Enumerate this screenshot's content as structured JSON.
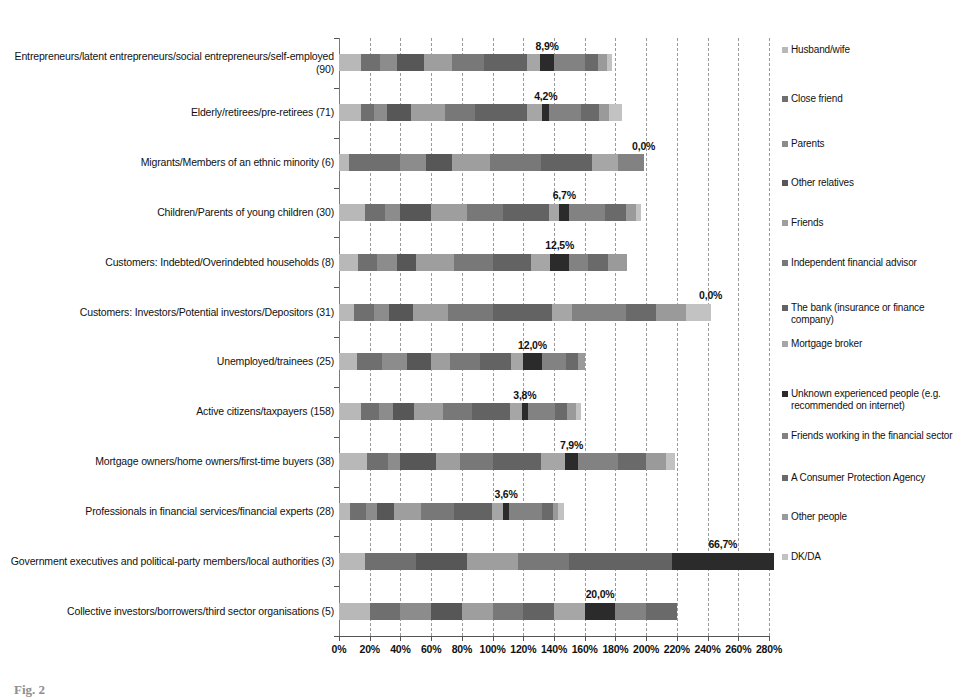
{
  "chart_data": {
    "type": "bar",
    "orientation": "horizontal",
    "stacked": true,
    "title": "",
    "xlabel": "",
    "ylabel": "",
    "xlim": [
      0,
      280
    ],
    "grid": true,
    "legend_position": "right",
    "xticklabels": [
      "0%",
      "20%",
      "40%",
      "60%",
      "80%",
      "100%",
      "120%",
      "140%",
      "160%",
      "180%",
      "200%",
      "220%",
      "240%",
      "260%",
      "280%"
    ],
    "xtickvalues": [
      0,
      20,
      40,
      60,
      80,
      100,
      120,
      140,
      160,
      180,
      200,
      220,
      240,
      260,
      280
    ],
    "categories": [
      "Entrepreneurs/latent entrepreneurs/social entrepreneurs/self-employed (90)",
      "Elderly/retirees/pre-retirees (71)",
      "Migrants/Members of an ethnic minority (6)",
      "Children/Parents of young children (30)",
      "Customers: Indebted/Overindebted households (8)",
      "Customers: Investors/Potential investors/Depositors (31)",
      "Unemployed/trainees (25)",
      "Active citizens/taxpayers (158)",
      "Mortgage owners/home owners/first-time buyers (38)",
      "Professionals in financial services/financial experts (28)",
      "Government executives and political-party members/local authorities (3)",
      "Collective investors/borrowers/third sector organisations (5)"
    ],
    "series": [
      {
        "name": "Husband/wife",
        "color": "#b8b8b8",
        "values": [
          14.4,
          14.1,
          6.7,
          16.7,
          12.5,
          9.7,
          12.0,
          14.6,
          18.4,
          7.1,
          16.7,
          20.0
        ]
      },
      {
        "name": "Close friend",
        "color": "#6f6f6f",
        "values": [
          12.2,
          8.5,
          33.3,
          13.3,
          12.5,
          12.9,
          16.0,
          11.4,
          13.2,
          10.7,
          33.3,
          20.0
        ]
      },
      {
        "name": "Parents",
        "color": "#8c8c8c",
        "values": [
          11.1,
          8.5,
          16.7,
          10.0,
          12.5,
          9.7,
          16.0,
          9.5,
          7.9,
          7.1,
          0.0,
          20.0
        ]
      },
      {
        "name": "Other relatives",
        "color": "#575757",
        "values": [
          17.8,
          15.5,
          16.7,
          20.0,
          12.5,
          16.1,
          16.0,
          13.3,
          23.7,
          10.7,
          33.3,
          20.0
        ]
      },
      {
        "name": "Friends",
        "color": "#9e9e9e",
        "values": [
          17.8,
          22.5,
          25.0,
          23.3,
          25.0,
          22.6,
          12.0,
          19.0,
          15.8,
          17.9,
          33.3,
          20.0
        ]
      },
      {
        "name": "Independent financial advisor",
        "color": "#787878",
        "values": [
          21.1,
          19.7,
          33.3,
          23.3,
          25.0,
          29.0,
          20.0,
          19.0,
          21.1,
          21.4,
          33.3,
          20.0
        ]
      },
      {
        "name": "The bank (insurance or finance company)",
        "color": "#636363",
        "values": [
          27.8,
          33.8,
          33.3,
          30.0,
          25.0,
          38.7,
          20.0,
          24.7,
          31.6,
          25.0,
          66.7,
          20.0
        ]
      },
      {
        "name": "Mortgage broker",
        "color": "#a6a6a6",
        "values": [
          8.9,
          9.9,
          16.7,
          6.7,
          12.5,
          12.9,
          8.0,
          7.6,
          15.8,
          7.1,
          0.0,
          20.0
        ]
      },
      {
        "name": "Unknown experienced people (e.g. recommended on internet)",
        "color": "#2b2b2b",
        "values": [
          8.9,
          4.2,
          0.0,
          6.7,
          12.5,
          0.0,
          12.0,
          3.8,
          7.9,
          3.6,
          66.7,
          20.0
        ]
      },
      {
        "name": "Friends working in the financial sector",
        "color": "#828282",
        "values": [
          20.0,
          21.1,
          16.7,
          23.3,
          12.5,
          35.5,
          16.0,
          17.7,
          26.3,
          21.4,
          0.0,
          20.0
        ]
      },
      {
        "name": "A Consumer Protection Agency",
        "color": "#6a6a6a",
        "values": [
          8.9,
          11.3,
          0.0,
          13.3,
          12.5,
          19.4,
          8.0,
          8.2,
          18.4,
          7.1,
          0.0,
          20.0
        ]
      },
      {
        "name": "Other people",
        "color": "#9a9a9a",
        "values": [
          5.6,
          7.0,
          0.0,
          6.7,
          12.5,
          19.4,
          4.0,
          5.7,
          13.2,
          3.6,
          0.0,
          0.0
        ]
      },
      {
        "name": "DK/DA",
        "color": "#c2c2c2",
        "values": [
          3.3,
          8.5,
          0.0,
          3.3,
          0.0,
          16.1,
          0.0,
          3.2,
          5.3,
          3.6,
          0.0,
          0.0
        ]
      }
    ],
    "highlighted_series": "Unknown experienced people (e.g. recommended on internet)",
    "data_labels": [
      "8,9%",
      "4,2%",
      "0,0%",
      "6,7%",
      "12,5%",
      "0,0%",
      "12,0%",
      "3,8%",
      "7,9%",
      "3,6%",
      "66,7%",
      "20,0%"
    ],
    "bar_totals": [
      178,
      185,
      198,
      197,
      187,
      242,
      160,
      158,
      219,
      146,
      270,
      200
    ]
  },
  "legend": {
    "items": [
      {
        "label": "Husband/wife",
        "color": "#b8b8b8"
      },
      {
        "label": "Close friend",
        "color": "#6f6f6f"
      },
      {
        "label": "Parents",
        "color": "#8c8c8c"
      },
      {
        "label": "Other relatives",
        "color": "#575757"
      },
      {
        "label": "Friends",
        "color": "#9e9e9e"
      },
      {
        "label": "Independent financial advisor",
        "color": "#787878"
      },
      {
        "label": "The bank (insurance or finance company)",
        "color": "#636363"
      },
      {
        "label": "Mortgage broker",
        "color": "#a6a6a6"
      },
      {
        "label": "Unknown experienced people (e.g. recommended on internet)",
        "color": "#2b2b2b"
      },
      {
        "label": "Friends working in the financial sector",
        "color": "#828282"
      },
      {
        "label": "A Consumer Protection Agency",
        "color": "#6a6a6a"
      },
      {
        "label": "Other people",
        "color": "#9a9a9a"
      },
      {
        "label": "DK/DA",
        "color": "#c2c2c2"
      }
    ]
  },
  "caption": {
    "text": "Fig. 2"
  }
}
